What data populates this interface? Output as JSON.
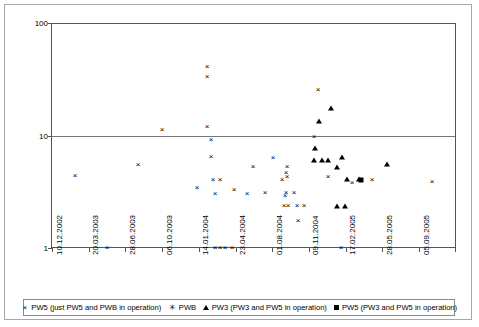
{
  "chart_data": {
    "type": "scatter",
    "title": "",
    "xlabel": "",
    "ylabel": "Coliforms [MPN/100 ml]",
    "yscale": "log",
    "ylim": [
      1,
      100
    ],
    "yticks": [
      "1",
      "10",
      "100"
    ],
    "grid": true,
    "legend_position": "bottom",
    "xticklabels": [
      "10.12.2002",
      "20.03.2003",
      "28.06.2003",
      "06.10.2003",
      "14.01.2004",
      "23.04.2004",
      "01.08.2004",
      "09.11.2004",
      "17.02.2005",
      "28.05.2005",
      "05.09.2005"
    ],
    "series": [
      {
        "name": "PW5 (just PW5 and PWB in operation)",
        "marker": "cross",
        "glyph": "×",
        "points": [
          {
            "x": 74,
            "y": 4.4
          },
          {
            "x": 106,
            "y": 1.0
          },
          {
            "x": 137,
            "y": 5.5
          },
          {
            "x": 161,
            "y": 11.2
          },
          {
            "x": 196,
            "y": 3.4
          },
          {
            "x": 206,
            "y": 41.0
          },
          {
            "x": 206,
            "y": 33.0
          },
          {
            "x": 206,
            "y": 11.8
          },
          {
            "x": 210,
            "y": 9.2
          },
          {
            "x": 210,
            "y": 6.5
          },
          {
            "x": 212,
            "y": 4.0
          },
          {
            "x": 219,
            "y": 4.0
          },
          {
            "x": 214,
            "y": 3.0
          },
          {
            "x": 214,
            "y": 1.0
          },
          {
            "x": 219,
            "y": 1.0
          },
          {
            "x": 224,
            "y": 1.0
          },
          {
            "x": 231,
            "y": 1.0
          },
          {
            "x": 233,
            "y": 3.3
          },
          {
            "x": 246,
            "y": 3.0
          },
          {
            "x": 252,
            "y": 5.3
          },
          {
            "x": 264,
            "y": 3.1
          },
          {
            "x": 272,
            "y": 6.3
          },
          {
            "x": 281,
            "y": 4.0
          },
          {
            "x": 286,
            "y": 5.2
          },
          {
            "x": 285,
            "y": 4.6
          },
          {
            "x": 286,
            "y": 4.3
          },
          {
            "x": 285,
            "y": 3.1
          },
          {
            "x": 284,
            "y": 2.9
          },
          {
            "x": 283,
            "y": 2.35
          },
          {
            "x": 287,
            "y": 2.35
          },
          {
            "x": 293,
            "y": 3.1
          },
          {
            "x": 296,
            "y": 2.35
          },
          {
            "x": 303,
            "y": 2.35
          },
          {
            "x": 297,
            "y": 1.75
          },
          {
            "x": 313,
            "y": 9.6
          },
          {
            "x": 317,
            "y": 25.5
          },
          {
            "x": 327,
            "y": 4.3
          },
          {
            "x": 340,
            "y": 1.0
          },
          {
            "x": 351,
            "y": 3.8
          },
          {
            "x": 371,
            "y": 4.0
          },
          {
            "x": 431,
            "y": 3.9
          }
        ]
      },
      {
        "name": "PWB",
        "marker": "star",
        "glyph": "✳",
        "points": []
      },
      {
        "name": "PW3 (PW3 and PW5 in operation)",
        "marker": "triangle",
        "glyph": "▲",
        "points": [
          {
            "x": 318,
            "y": 13.5
          },
          {
            "x": 330,
            "y": 17.5
          },
          {
            "x": 314,
            "y": 7.7
          },
          {
            "x": 313,
            "y": 6.1
          },
          {
            "x": 321,
            "y": 6.1
          },
          {
            "x": 327,
            "y": 6.1
          },
          {
            "x": 336,
            "y": 5.2
          },
          {
            "x": 341,
            "y": 6.4
          },
          {
            "x": 346,
            "y": 4.1
          },
          {
            "x": 358,
            "y": 4.1
          },
          {
            "x": 336,
            "y": 2.35
          },
          {
            "x": 344,
            "y": 2.35
          },
          {
            "x": 386,
            "y": 5.6
          }
        ]
      },
      {
        "name": "PW5 (PW3 and PW5 in operation)",
        "marker": "square",
        "glyph": "■",
        "points": [
          {
            "x": 360,
            "y": 4.05
          }
        ]
      }
    ]
  },
  "legend": {
    "items": [
      {
        "symbol": "×",
        "label": "PW5 (just PW5 and PWB in operation)"
      },
      {
        "symbol": "✳",
        "label": "PWB"
      },
      {
        "symbol": "▲",
        "label": "PW3 (PW3 and PW5 in operation)"
      },
      {
        "symbol": "■",
        "label": "PW5 (PW3 and PW5 in operation)"
      }
    ]
  },
  "colors": {
    "marker": "#000000",
    "axis": "#555555",
    "grid": "#777777",
    "frame": "#a8a8a8",
    "background": "#ffffff"
  }
}
